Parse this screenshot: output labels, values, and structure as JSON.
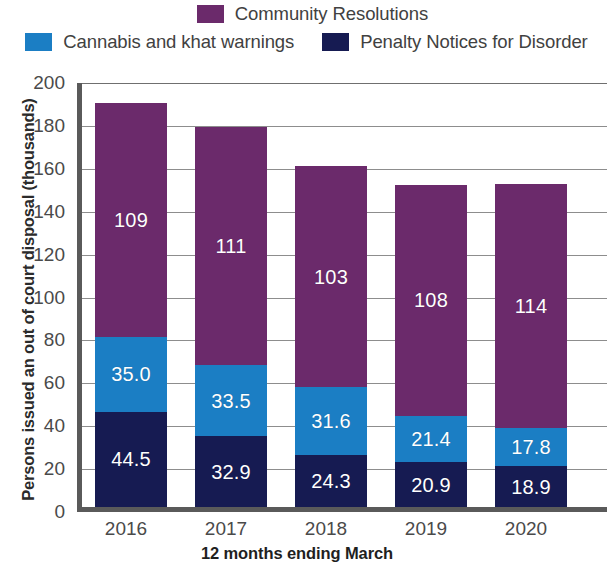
{
  "legend": {
    "rows": [
      [
        {
          "label": "Community Resolutions",
          "color": "#6B2A6B",
          "swatch_name": "legend-swatch-community-resolutions"
        }
      ],
      [
        {
          "label": "Cannabis and khat warnings",
          "color": "#1B7EC4",
          "swatch_name": "legend-swatch-cannabis-and-khat-warnings"
        },
        {
          "label": "Penalty Notices for Disorder",
          "color": "#161B52",
          "swatch_name": "legend-swatch-penalty-notices-for-disorder"
        }
      ]
    ]
  },
  "axes": {
    "y_title": "Persons issued an out of court disposal (thousands)",
    "x_title": "12 months ending March",
    "y_ticks": [
      "0",
      "20",
      "40",
      "60",
      "80",
      "100",
      "120",
      "140",
      "160",
      "180",
      "200"
    ]
  },
  "chart_data": {
    "type": "bar",
    "title": "",
    "subtitle": "",
    "xlabel": "12 months ending March",
    "ylabel": "Persons issued an out of court disposal (thousands)",
    "categories": [
      "2016",
      "2017",
      "2018",
      "2019",
      "2020"
    ],
    "ylim": [
      0,
      200
    ],
    "ytick_step": 20,
    "grid": true,
    "stacked": true,
    "legend_position": "top",
    "series": [
      {
        "name": "Penalty Notices for Disorder",
        "color": "#161B52",
        "values": [
          44.5,
          32.9,
          24.3,
          20.9,
          18.9
        ],
        "labels": [
          "44.5",
          "32.9",
          "24.3",
          "20.9",
          "18.9"
        ]
      },
      {
        "name": "Cannabis and khat warnings",
        "color": "#1B7EC4",
        "values": [
          35.0,
          33.5,
          31.6,
          21.4,
          17.8
        ],
        "labels": [
          "35.0",
          "33.5",
          "31.6",
          "21.4",
          "17.8"
        ]
      },
      {
        "name": "Community Resolutions",
        "color": "#6B2A6B",
        "values": [
          109,
          111,
          103,
          108,
          114
        ],
        "labels": [
          "109",
          "111",
          "103",
          "108",
          "114"
        ]
      }
    ],
    "totals": [
      188.5,
      177.4,
      158.9,
      150.3,
      150.7
    ]
  }
}
